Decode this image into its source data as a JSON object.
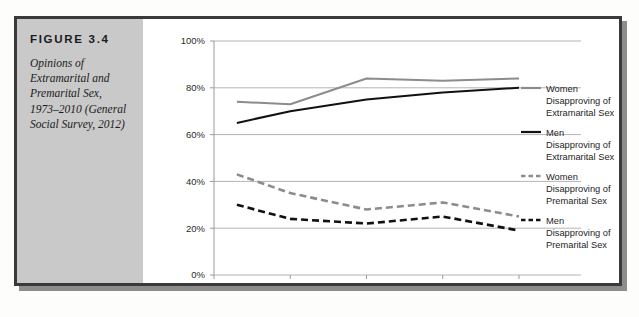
{
  "figure": {
    "number_label": "FIGURE 3.4",
    "caption": "Opinions of Extramarital and Premarital Sex, 1973–2010 (General Social Survey, 2012)"
  },
  "colors": {
    "gray_series": "#8c8c8c",
    "black_series": "#111111",
    "gridline": "#b4b4b4",
    "caption_panel": "#c9c9c9",
    "figure_border": "#3a3a3a"
  },
  "chart_data": {
    "type": "line",
    "title": "",
    "xlabel": "",
    "ylabel": "",
    "xlim": [
      1970,
      2012
    ],
    "ylim": [
      0,
      100
    ],
    "grid": true,
    "legend_position": "right",
    "x_ticks": [
      "1970",
      "1980",
      "1990",
      "2000",
      "2010"
    ],
    "x_tick_values": [
      1970,
      1980,
      1990,
      2000,
      2010
    ],
    "y_ticks": [
      "0%",
      "20%",
      "40%",
      "60%",
      "80%",
      "100%"
    ],
    "y_tick_values": [
      0,
      20,
      40,
      60,
      80,
      100
    ],
    "x": [
      1973,
      1980,
      1990,
      2000,
      2010
    ],
    "series": [
      {
        "name": "Women Disapproving of Extramarital Sex",
        "style": "solid",
        "color": "#8c8c8c",
        "values": [
          74,
          73,
          84,
          83,
          84
        ]
      },
      {
        "name": "Men Disapproving of Extramarital Sex",
        "style": "solid",
        "color": "#111111",
        "values": [
          65,
          70,
          75,
          78,
          80
        ]
      },
      {
        "name": "Women Disapproving of Premarital Sex",
        "style": "dashed",
        "color": "#8c8c8c",
        "values": [
          43,
          35,
          28,
          31,
          25
        ]
      },
      {
        "name": "Men Disapproving of Premarital Sex",
        "style": "dashed",
        "color": "#111111",
        "values": [
          30,
          24,
          22,
          25,
          19
        ]
      }
    ]
  },
  "legend": {
    "items": [
      {
        "line1": "Women",
        "line2": "Disapproving of",
        "line3": "Extramarital Sex"
      },
      {
        "line1": "Men",
        "line2": "Disapproving of",
        "line3": "Extramarital Sex"
      },
      {
        "line1": "Women",
        "line2": "Disapproving of",
        "line3": "Premarital Sex"
      },
      {
        "line1": "Men",
        "line2": "Disapproving of",
        "line3": "Premarital Sex"
      }
    ]
  }
}
